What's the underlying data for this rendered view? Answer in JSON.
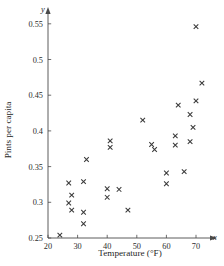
{
  "chart_data": {
    "type": "scatter",
    "title": "",
    "xlabel": "Temperature (°F)",
    "ylabel": "Pints per capita",
    "x_axis_variable": "x",
    "y_axis_variable": "y",
    "xlim": [
      20,
      74
    ],
    "ylim": [
      0.25,
      0.57
    ],
    "xticks": [
      20,
      30,
      40,
      50,
      60,
      70
    ],
    "xtick_labels": [
      "20",
      "30",
      "40",
      "50",
      "60",
      "70"
    ],
    "yticks": [
      0.25,
      0.3,
      0.35,
      0.4,
      0.45,
      0.5,
      0.55
    ],
    "ytick_labels": [
      "0.25",
      "0.3",
      "0.35",
      "0.4",
      "0.45",
      "0.5",
      "0.55"
    ],
    "grid": false,
    "legend": false,
    "marker_style": "x-cross",
    "marker_color": "#3a3a3a",
    "point_count": 30,
    "points": [
      {
        "x": 24,
        "y": 0.254
      },
      {
        "x": 27,
        "y": 0.299
      },
      {
        "x": 27,
        "y": 0.327
      },
      {
        "x": 28,
        "y": 0.31
      },
      {
        "x": 28,
        "y": 0.289
      },
      {
        "x": 32,
        "y": 0.329
      },
      {
        "x": 32,
        "y": 0.286
      },
      {
        "x": 32,
        "y": 0.27
      },
      {
        "x": 33,
        "y": 0.36
      },
      {
        "x": 40,
        "y": 0.307
      },
      {
        "x": 40,
        "y": 0.319
      },
      {
        "x": 41,
        "y": 0.377
      },
      {
        "x": 41,
        "y": 0.386
      },
      {
        "x": 44,
        "y": 0.318
      },
      {
        "x": 47,
        "y": 0.289
      },
      {
        "x": 52,
        "y": 0.415
      },
      {
        "x": 55,
        "y": 0.381
      },
      {
        "x": 56,
        "y": 0.374
      },
      {
        "x": 60,
        "y": 0.341
      },
      {
        "x": 60,
        "y": 0.326
      },
      {
        "x": 63,
        "y": 0.38
      },
      {
        "x": 63,
        "y": 0.393
      },
      {
        "x": 64,
        "y": 0.436
      },
      {
        "x": 66,
        "y": 0.343
      },
      {
        "x": 68,
        "y": 0.385
      },
      {
        "x": 68,
        "y": 0.423
      },
      {
        "x": 69,
        "y": 0.405
      },
      {
        "x": 70,
        "y": 0.442
      },
      {
        "x": 70,
        "y": 0.546
      },
      {
        "x": 72,
        "y": 0.467
      }
    ]
  }
}
